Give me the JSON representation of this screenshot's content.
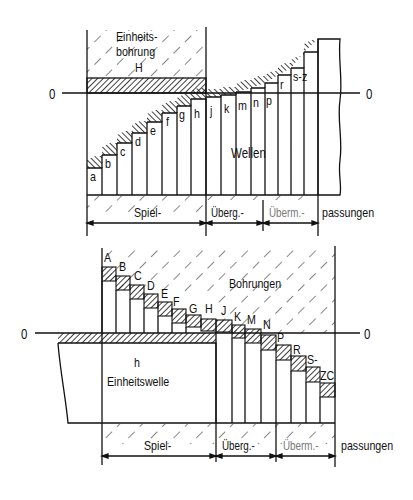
{
  "top": {
    "zero_left": "0",
    "zero_right": "0",
    "hole_title_line1": "Einheits-",
    "hole_title_line2": "bohrung",
    "hole_symbol": "H",
    "shaft_label": "Wellen",
    "bar_letters": [
      "a",
      "b",
      "c",
      "d",
      "e",
      "f",
      "g",
      "h",
      "j",
      "k",
      "m",
      "n",
      "p",
      "r",
      "s-z"
    ],
    "fit_labels": {
      "clearance": "Spiel-",
      "transition": "Überg.-",
      "interference": "Überm.-",
      "suffix": "passungen"
    }
  },
  "bottom": {
    "zero_left": "0",
    "zero_right": "0",
    "hole_label": "Bohrungen",
    "shaft_symbol": "h",
    "shaft_title": "Einheitswelle",
    "bar_letters": [
      "A",
      "B",
      "C",
      "D",
      "E",
      "F",
      "G",
      "H",
      "J",
      "K",
      "M",
      "N",
      "P",
      "R",
      "S-",
      "ZC"
    ],
    "fit_labels": {
      "clearance": "Spiel-",
      "transition": "Überg.-",
      "interference": "Überm.-",
      "suffix": "passungen"
    }
  }
}
